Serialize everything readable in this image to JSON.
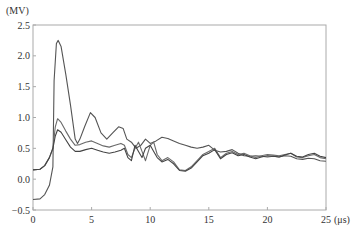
{
  "chart_data": {
    "type": "line",
    "title": "",
    "xlabel": "(μs)",
    "ylabel": "(MV)",
    "xlim": [
      0,
      25
    ],
    "ylim": [
      -0.5,
      2.5
    ],
    "xticks": [
      "0",
      "5",
      "10",
      "15",
      "20",
      "25"
    ],
    "yticks": [
      "-0.5",
      "0.0",
      "0.5",
      "1.0",
      "1.5",
      "2.0",
      "2.5"
    ],
    "grid": false,
    "legend": null,
    "series": [
      {
        "name": "curve-1",
        "color": "#555555",
        "points": [
          [
            0,
            -0.33
          ],
          [
            0.6,
            -0.32
          ],
          [
            1.0,
            -0.25
          ],
          [
            1.4,
            -0.1
          ],
          [
            1.7,
            0.2
          ],
          [
            1.8,
            1.6
          ],
          [
            2.0,
            2.2
          ],
          [
            2.15,
            2.25
          ],
          [
            2.4,
            2.15
          ],
          [
            2.8,
            1.7
          ],
          [
            3.2,
            1.2
          ],
          [
            3.6,
            0.65
          ],
          [
            3.8,
            0.58
          ],
          [
            4.0,
            0.65
          ],
          [
            4.4,
            0.85
          ],
          [
            4.9,
            1.08
          ],
          [
            5.3,
            1.0
          ],
          [
            5.8,
            0.75
          ],
          [
            6.3,
            0.65
          ],
          [
            6.8,
            0.75
          ],
          [
            7.3,
            0.85
          ],
          [
            7.7,
            0.82
          ],
          [
            8.0,
            0.65
          ],
          [
            8.4,
            0.6
          ],
          [
            8.8,
            0.5
          ],
          [
            9.2,
            0.55
          ],
          [
            9.6,
            0.65
          ],
          [
            10.0,
            0.58
          ],
          [
            10.5,
            0.62
          ],
          [
            11.0,
            0.68
          ],
          [
            11.5,
            0.66
          ],
          [
            12.0,
            0.62
          ],
          [
            12.5,
            0.58
          ],
          [
            13.0,
            0.55
          ],
          [
            13.5,
            0.52
          ],
          [
            14.0,
            0.5
          ],
          [
            14.5,
            0.52
          ],
          [
            15.0,
            0.55
          ],
          [
            15.5,
            0.47
          ],
          [
            16.0,
            0.44
          ],
          [
            16.5,
            0.45
          ],
          [
            17.0,
            0.48
          ],
          [
            17.5,
            0.42
          ],
          [
            18.0,
            0.38
          ],
          [
            18.5,
            0.37
          ],
          [
            19.0,
            0.38
          ],
          [
            19.5,
            0.37
          ],
          [
            20.0,
            0.36
          ],
          [
            20.5,
            0.37
          ],
          [
            21.0,
            0.36
          ],
          [
            21.5,
            0.38
          ],
          [
            22.0,
            0.37
          ],
          [
            22.5,
            0.33
          ],
          [
            23.0,
            0.32
          ],
          [
            23.5,
            0.34
          ],
          [
            24.0,
            0.33
          ],
          [
            24.5,
            0.3
          ],
          [
            25.0,
            0.29
          ]
        ]
      },
      {
        "name": "curve-2",
        "color": "#6a6a6a",
        "points": [
          [
            0,
            0.15
          ],
          [
            0.6,
            0.16
          ],
          [
            1.0,
            0.22
          ],
          [
            1.4,
            0.35
          ],
          [
            1.7,
            0.5
          ],
          [
            1.9,
            0.85
          ],
          [
            2.1,
            0.98
          ],
          [
            2.4,
            0.92
          ],
          [
            2.8,
            0.78
          ],
          [
            3.2,
            0.65
          ],
          [
            3.6,
            0.55
          ],
          [
            4.0,
            0.56
          ],
          [
            4.5,
            0.6
          ],
          [
            5.0,
            0.62
          ],
          [
            5.5,
            0.58
          ],
          [
            6.0,
            0.54
          ],
          [
            6.5,
            0.52
          ],
          [
            7.0,
            0.55
          ],
          [
            7.5,
            0.58
          ],
          [
            7.8,
            0.55
          ],
          [
            8.1,
            0.4
          ],
          [
            8.4,
            0.35
          ],
          [
            8.7,
            0.5
          ],
          [
            9.0,
            0.6
          ],
          [
            9.3,
            0.45
          ],
          [
            9.6,
            0.3
          ],
          [
            10.0,
            0.55
          ],
          [
            10.3,
            0.6
          ],
          [
            10.6,
            0.4
          ],
          [
            11.0,
            0.3
          ],
          [
            11.5,
            0.35
          ],
          [
            12.0,
            0.28
          ],
          [
            12.5,
            0.15
          ],
          [
            13.0,
            0.14
          ],
          [
            13.5,
            0.2
          ],
          [
            14.0,
            0.3
          ],
          [
            14.5,
            0.4
          ],
          [
            15.0,
            0.45
          ],
          [
            15.5,
            0.5
          ],
          [
            16.0,
            0.35
          ],
          [
            16.5,
            0.42
          ],
          [
            17.0,
            0.45
          ],
          [
            17.5,
            0.4
          ],
          [
            18.0,
            0.42
          ],
          [
            18.5,
            0.38
          ],
          [
            19.0,
            0.35
          ],
          [
            19.5,
            0.38
          ],
          [
            20.0,
            0.4
          ],
          [
            20.5,
            0.39
          ],
          [
            21.0,
            0.38
          ],
          [
            21.5,
            0.4
          ],
          [
            22.0,
            0.42
          ],
          [
            22.5,
            0.36
          ],
          [
            23.0,
            0.35
          ],
          [
            23.5,
            0.38
          ],
          [
            24.0,
            0.4
          ],
          [
            24.5,
            0.35
          ],
          [
            25.0,
            0.33
          ]
        ]
      },
      {
        "name": "curve-3",
        "color": "#444444",
        "points": [
          [
            0,
            0.15
          ],
          [
            0.6,
            0.16
          ],
          [
            1.0,
            0.22
          ],
          [
            1.4,
            0.35
          ],
          [
            1.7,
            0.5
          ],
          [
            1.9,
            0.7
          ],
          [
            2.1,
            0.8
          ],
          [
            2.4,
            0.76
          ],
          [
            2.8,
            0.64
          ],
          [
            3.2,
            0.52
          ],
          [
            3.6,
            0.45
          ],
          [
            4.0,
            0.45
          ],
          [
            4.5,
            0.48
          ],
          [
            5.0,
            0.5
          ],
          [
            5.5,
            0.47
          ],
          [
            6.0,
            0.44
          ],
          [
            6.5,
            0.42
          ],
          [
            7.0,
            0.44
          ],
          [
            7.5,
            0.47
          ],
          [
            7.8,
            0.5
          ],
          [
            8.1,
            0.35
          ],
          [
            8.4,
            0.3
          ],
          [
            8.7,
            0.55
          ],
          [
            9.0,
            0.45
          ],
          [
            9.3,
            0.35
          ],
          [
            9.6,
            0.5
          ],
          [
            10.0,
            0.55
          ],
          [
            10.3,
            0.45
          ],
          [
            10.6,
            0.35
          ],
          [
            11.0,
            0.28
          ],
          [
            11.5,
            0.32
          ],
          [
            12.0,
            0.25
          ],
          [
            12.5,
            0.14
          ],
          [
            13.0,
            0.13
          ],
          [
            13.5,
            0.18
          ],
          [
            14.0,
            0.28
          ],
          [
            14.5,
            0.38
          ],
          [
            15.0,
            0.42
          ],
          [
            15.5,
            0.48
          ],
          [
            16.0,
            0.33
          ],
          [
            16.5,
            0.4
          ],
          [
            17.0,
            0.43
          ],
          [
            17.5,
            0.38
          ],
          [
            18.0,
            0.4
          ],
          [
            18.5,
            0.36
          ],
          [
            19.0,
            0.33
          ],
          [
            19.5,
            0.36
          ],
          [
            20.0,
            0.38
          ],
          [
            20.5,
            0.37
          ],
          [
            21.0,
            0.36
          ],
          [
            21.5,
            0.39
          ],
          [
            22.0,
            0.42
          ],
          [
            22.5,
            0.37
          ],
          [
            23.0,
            0.36
          ],
          [
            23.5,
            0.4
          ],
          [
            24.0,
            0.42
          ],
          [
            24.5,
            0.37
          ],
          [
            25.0,
            0.35
          ]
        ]
      }
    ]
  }
}
